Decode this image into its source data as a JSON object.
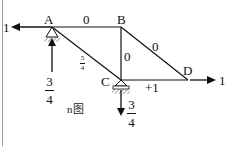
{
  "diagram": {
    "type": "truss internal force diagram",
    "caption": "n图",
    "nodes": {
      "A": {
        "label": "A"
      },
      "B": {
        "label": "B"
      },
      "C": {
        "label": "C"
      },
      "D": {
        "label": "D"
      }
    },
    "members": {
      "AB": "0",
      "BC": "0",
      "BD": "0",
      "CD": "+1",
      "AC": {
        "num": "5",
        "den": "4"
      }
    },
    "loads": {
      "A_left": "1",
      "D_right": "1"
    },
    "reactions": {
      "A_up": {
        "num": "3",
        "den": "4"
      },
      "C_down": {
        "num": "3",
        "den": "4"
      }
    },
    "colors": {
      "line": "#111111",
      "frame": "#9a9a9a"
    }
  }
}
